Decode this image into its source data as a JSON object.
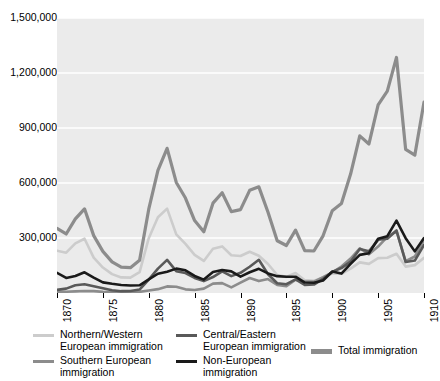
{
  "chart_data": {
    "type": "line",
    "title": "",
    "subtitle": "",
    "xlabel": "",
    "ylabel": "",
    "xlim": [
      1870,
      1910
    ],
    "ylim": [
      0,
      1500000
    ],
    "grid": true,
    "grid_axis": "y",
    "legend_position": "bottom",
    "y_ticks": [
      0,
      300000,
      600000,
      900000,
      1200000,
      1500000
    ],
    "y_tick_labels": [
      "0",
      "300,000",
      "600,000",
      "900,000",
      "1,200,000",
      "1,500,000"
    ],
    "y_tick_labels_shown": [
      "300,000",
      "600,000",
      "900,000",
      "1,200,000",
      "1,500,000"
    ],
    "x_ticks": [
      1870,
      1875,
      1880,
      1885,
      1890,
      1895,
      1900,
      1905,
      1910
    ],
    "x_tick_labels": [
      "1870",
      "1875",
      "1880",
      "1885",
      "1890",
      "1895",
      "1900",
      "1905",
      "1910"
    ],
    "x": [
      1870,
      1871,
      1872,
      1873,
      1874,
      1875,
      1876,
      1877,
      1878,
      1879,
      1880,
      1881,
      1882,
      1883,
      1884,
      1885,
      1886,
      1887,
      1888,
      1889,
      1890,
      1891,
      1892,
      1893,
      1894,
      1895,
      1896,
      1897,
      1898,
      1899,
      1900,
      1901,
      1902,
      1903,
      1904,
      1905,
      1906,
      1907,
      1908,
      1909,
      1910
    ],
    "series": [
      {
        "name": "Total immigration",
        "color": "#8c8c8c",
        "width": 3.2,
        "values": [
          352000,
          322000,
          404000,
          459000,
          313000,
          227000,
          170000,
          141000,
          138000,
          178000,
          457000,
          669000,
          789000,
          603000,
          518000,
          395000,
          334000,
          490000,
          547000,
          444000,
          455000,
          560000,
          579000,
          440000,
          285000,
          259000,
          343000,
          231000,
          229000,
          312000,
          449000,
          488000,
          649000,
          857000,
          813000,
          1026000,
          1101000,
          1285000,
          783000,
          752000,
          1041000
        ]
      },
      {
        "name": "Northern/Western European immigration",
        "color": "#cccccc",
        "width": 2.6,
        "values": [
          231000,
          220000,
          271000,
          296000,
          193000,
          139000,
          103000,
          85000,
          84000,
          114000,
          299000,
          413000,
          460000,
          320000,
          268000,
          208000,
          175000,
          241000,
          254000,
          206000,
          202000,
          225000,
          203000,
          158000,
          98000,
          88000,
          109000,
          70000,
          67000,
          83000,
          107000,
          105000,
          133000,
          167000,
          159000,
          190000,
          192000,
          214000,
          144000,
          152000,
          192000
        ]
      },
      {
        "name": "Southern European immigration",
        "color": "#8c8c8c",
        "width": 2.6,
        "values": [
          6000,
          7000,
          9000,
          11000,
          10000,
          6000,
          4000,
          4000,
          5000,
          6000,
          14000,
          21000,
          36000,
          34000,
          20000,
          16000,
          24000,
          51000,
          54000,
          31000,
          57000,
          82000,
          65000,
          76000,
          44000,
          37000,
          73000,
          62000,
          62000,
          86000,
          112000,
          144000,
          188000,
          244000,
          211000,
          253000,
          306000,
          338000,
          174000,
          199000,
          290000
        ]
      },
      {
        "name": "Central/Eastern European immigration",
        "color": "#595959",
        "width": 2.6,
        "values": [
          17000,
          24000,
          42000,
          48000,
          37000,
          26000,
          15000,
          10000,
          11000,
          19000,
          73000,
          133000,
          181000,
          119000,
          109000,
          82000,
          65000,
          87000,
          118000,
          92000,
          110000,
          143000,
          181000,
          102000,
          53000,
          48000,
          74000,
          44000,
          46000,
          77000,
          115000,
          136000,
          171000,
          240000,
          228000,
          290000,
          296000,
          341000,
          169000,
          177000,
          262000
        ]
      },
      {
        "name": "Non-European immigration",
        "color": "#1a1a1a",
        "width": 2.6,
        "values": [
          110000,
          82000,
          93000,
          113000,
          84000,
          58000,
          50000,
          44000,
          41000,
          42000,
          74000,
          105000,
          116000,
          133000,
          124000,
          93000,
          73000,
          115000,
          125000,
          118000,
          89000,
          113000,
          132000,
          107000,
          92000,
          89000,
          89000,
          57000,
          56000,
          68000,
          117000,
          106000,
          159000,
          208000,
          217000,
          296000,
          310000,
          395000,
          299000,
          227000,
          300000
        ]
      }
    ]
  },
  "axes": {
    "y_labels": [
      "1,500,000",
      "1,200,000",
      "900,000",
      "600,000",
      "300,000"
    ],
    "x_labels": [
      "1870",
      "1875",
      "1880",
      "1885",
      "1890",
      "1895",
      "1900",
      "1905",
      "1910"
    ]
  },
  "legend": {
    "entries": [
      {
        "label": "Northern/Western\nEuropean immigration",
        "color": "#cccccc",
        "thick": false
      },
      {
        "label": "Central/Eastern\nEuropean immigration",
        "color": "#595959",
        "thick": false
      },
      {
        "label": "Southern European\nimmigration",
        "color": "#8c8c8c",
        "thick": false
      },
      {
        "label": "Non-European\nimmigration",
        "color": "#1a1a1a",
        "thick": false
      },
      {
        "label": "Total immigration",
        "color": "#8c8c8c",
        "thick": true
      }
    ]
  },
  "colors": {
    "plot_background": "#ebebeb",
    "gridline": "#ffffff",
    "axis": "#000000",
    "page_background": "#ffffff"
  }
}
